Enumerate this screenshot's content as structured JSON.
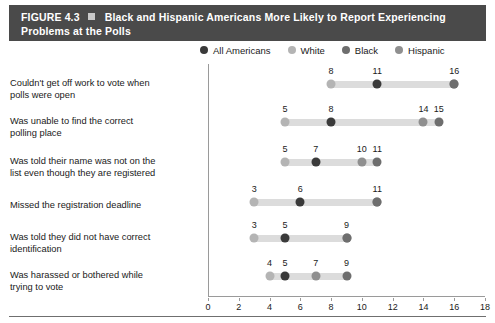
{
  "figure": {
    "number_label": "FIGURE 4.3",
    "marker_icon": "square-bullet-icon",
    "title": "Black and Hispanic Americans More Likely to Report Experiencing",
    "title_line2": "Problems at the Polls"
  },
  "legend": {
    "position": "top-right",
    "items": [
      {
        "label": "All Americans",
        "color": "#3a3a3a"
      },
      {
        "label": "White",
        "color": "#b4b4b4"
      },
      {
        "label": "Black",
        "color": "#6e6e6e"
      },
      {
        "label": "Hispanic",
        "color": "#8f8f8f"
      }
    ]
  },
  "chart_data": {
    "type": "scatter",
    "subtype": "dumbbell-dot-plot",
    "title": "Black and Hispanic Americans More Likely to Report Experiencing Problems at the Polls",
    "xlabel": "",
    "ylabel": "",
    "xlim": [
      0,
      18
    ],
    "xticks": [
      0,
      2,
      4,
      6,
      8,
      10,
      12,
      14,
      16,
      18
    ],
    "grid": false,
    "legend_position": "top-right",
    "series": [
      {
        "name": "All Americans",
        "color": "#3a3a3a",
        "values": [
          11,
          8,
          7,
          6,
          5,
          5
        ]
      },
      {
        "name": "White",
        "color": "#b4b4b4",
        "values": [
          8,
          5,
          5,
          3,
          3,
          4
        ]
      },
      {
        "name": "Black",
        "color": "#6e6e6e",
        "values": [
          16,
          15,
          11,
          11,
          9,
          9
        ]
      },
      {
        "name": "Hispanic",
        "color": "#8f8f8f",
        "values": [
          16,
          14,
          10,
          11,
          9,
          7
        ]
      }
    ],
    "categories": [
      "Couldn't get off work to vote when polls were open",
      "Was unable to find the correct polling place",
      "Was told their name was not on the list even though they are registered",
      "Missed the registration deadline",
      "Was told they did not have correct identification",
      "Was harassed or bothered while trying to vote"
    ],
    "rows": [
      {
        "label_line1": "Couldn't get off work to vote when",
        "label_line2": "polls were open",
        "range": [
          8,
          16
        ],
        "points": [
          {
            "series": "White",
            "value": 8,
            "color": "#b4b4b4",
            "data_label": "8"
          },
          {
            "series": "All Americans",
            "value": 11,
            "color": "#3a3a3a",
            "data_label": "11"
          },
          {
            "series": "Hispanic",
            "value": 16,
            "color": "#8f8f8f",
            "data_label": "16"
          },
          {
            "series": "Black",
            "value": 16,
            "color": "#6e6e6e",
            "data_label": ""
          }
        ]
      },
      {
        "label_line1": "Was unable to find the correct",
        "label_line2": "polling place",
        "range": [
          5,
          15
        ],
        "points": [
          {
            "series": "White",
            "value": 5,
            "color": "#b4b4b4",
            "data_label": "5"
          },
          {
            "series": "All Americans",
            "value": 8,
            "color": "#3a3a3a",
            "data_label": "8"
          },
          {
            "series": "Hispanic",
            "value": 14,
            "color": "#8f8f8f",
            "data_label": "14"
          },
          {
            "series": "Black",
            "value": 15,
            "color": "#6e6e6e",
            "data_label": "15"
          }
        ]
      },
      {
        "label_line1": "Was told their name was not on the",
        "label_line2": "list even though they are registered",
        "range": [
          5,
          11
        ],
        "points": [
          {
            "series": "White",
            "value": 5,
            "color": "#b4b4b4",
            "data_label": "5"
          },
          {
            "series": "All Americans",
            "value": 7,
            "color": "#3a3a3a",
            "data_label": "7"
          },
          {
            "series": "Hispanic",
            "value": 10,
            "color": "#8f8f8f",
            "data_label": "10"
          },
          {
            "series": "Black",
            "value": 11,
            "color": "#6e6e6e",
            "data_label": "11"
          }
        ]
      },
      {
        "label_line1": "Missed the registration deadline",
        "label_line2": "",
        "range": [
          3,
          11
        ],
        "points": [
          {
            "series": "White",
            "value": 3,
            "color": "#b4b4b4",
            "data_label": "3"
          },
          {
            "series": "All Americans",
            "value": 6,
            "color": "#3a3a3a",
            "data_label": "6"
          },
          {
            "series": "Hispanic",
            "value": 11,
            "color": "#8f8f8f",
            "data_label": "11"
          },
          {
            "series": "Black",
            "value": 11,
            "color": "#6e6e6e",
            "data_label": ""
          }
        ]
      },
      {
        "label_line1": "Was told they did not have correct",
        "label_line2": "identification",
        "range": [
          3,
          9
        ],
        "points": [
          {
            "series": "White",
            "value": 3,
            "color": "#b4b4b4",
            "data_label": "3"
          },
          {
            "series": "All Americans",
            "value": 5,
            "color": "#3a3a3a",
            "data_label": "5"
          },
          {
            "series": "Hispanic",
            "value": 9,
            "color": "#8f8f8f",
            "data_label": "9"
          },
          {
            "series": "Black",
            "value": 9,
            "color": "#6e6e6e",
            "data_label": ""
          }
        ]
      },
      {
        "label_line1": "Was harassed or bothered while",
        "label_line2": "trying to vote",
        "range": [
          4,
          9
        ],
        "points": [
          {
            "series": "White",
            "value": 4,
            "color": "#b4b4b4",
            "data_label": "4"
          },
          {
            "series": "All Americans",
            "value": 5,
            "color": "#3a3a3a",
            "data_label": "5"
          },
          {
            "series": "Hispanic",
            "value": 7,
            "color": "#8f8f8f",
            "data_label": "7"
          },
          {
            "series": "Black",
            "value": 9,
            "color": "#6e6e6e",
            "data_label": "9"
          }
        ]
      }
    ]
  }
}
